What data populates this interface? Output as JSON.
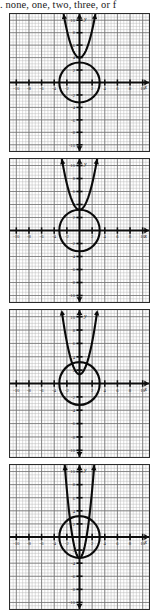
{
  "question": {
    "prefix": ".",
    "text": ". none, one, two, three, or f"
  },
  "axes": {
    "x_label": "x",
    "y_label": "y",
    "x_min": -11,
    "x_max": 11,
    "y_min": -11,
    "y_max": 11,
    "x_ticks": [
      -10,
      -8,
      -6,
      -4,
      -2,
      2,
      4,
      6,
      8,
      10
    ],
    "y_ticks": [
      -10,
      -8,
      -6,
      -4,
      -2,
      2,
      4,
      6,
      8,
      10
    ],
    "x_tick_labels": [
      "-10",
      "-8",
      "-6",
      "-4",
      "-2",
      "2",
      "4",
      "6",
      "8",
      "10"
    ],
    "y_tick_labels": [
      "-10",
      "-8",
      "-6",
      "-4",
      "-2",
      "2",
      "4",
      "6",
      "8",
      "10"
    ],
    "grid": true,
    "minor_step": 0.5,
    "major_step": 2
  },
  "colors": {
    "curve": "#0a0a0a",
    "axis": "#0d0d0d",
    "grid_minor": "#b9b9b9",
    "grid_major": "#6f6f6f",
    "panel_border": "#2b2b2b",
    "background": "#ffffff"
  },
  "chart_data": [
    {
      "type": "line",
      "id": "choice-a",
      "title": "",
      "xlabel": "x",
      "ylabel": "y",
      "xlim": [
        -11,
        11
      ],
      "ylim": [
        -11,
        11
      ],
      "grid": true,
      "intersections": 0,
      "series": [
        {
          "name": "circle",
          "kind": "circle",
          "center": [
            0,
            0
          ],
          "radius": 3.2
        },
        {
          "name": "parabola",
          "kind": "parabola",
          "vertex": [
            0,
            4.0
          ],
          "a": 1.1,
          "opens": "up"
        }
      ]
    },
    {
      "type": "line",
      "id": "choice-b",
      "title": "",
      "xlabel": "x",
      "ylabel": "y",
      "xlim": [
        -11,
        11
      ],
      "ylim": [
        -11,
        11
      ],
      "grid": true,
      "intersections": 1,
      "series": [
        {
          "name": "circle",
          "kind": "circle",
          "center": [
            0,
            0
          ],
          "radius": 3.2
        },
        {
          "name": "parabola",
          "kind": "parabola",
          "vertex": [
            0,
            3.2
          ],
          "a": 1.0,
          "opens": "up"
        }
      ]
    },
    {
      "type": "line",
      "id": "choice-c",
      "title": "",
      "xlabel": "x",
      "ylabel": "y",
      "xlim": [
        -11,
        11
      ],
      "ylim": [
        -11,
        11
      ],
      "grid": true,
      "intersections": 2,
      "series": [
        {
          "name": "circle",
          "kind": "circle",
          "center": [
            0,
            0
          ],
          "radius": 3.2
        },
        {
          "name": "parabola",
          "kind": "parabola",
          "vertex": [
            0,
            1.4
          ],
          "a": 1.2,
          "opens": "up"
        }
      ]
    },
    {
      "type": "line",
      "id": "choice-d",
      "title": "",
      "xlabel": "x",
      "ylabel": "y",
      "xlim": [
        -11,
        11
      ],
      "ylim": [
        -11,
        11
      ],
      "grid": true,
      "intersections": 4,
      "series": [
        {
          "name": "circle",
          "kind": "circle",
          "center": [
            0,
            0
          ],
          "radius": 3.2
        },
        {
          "name": "parabola",
          "kind": "parabola",
          "vertex": [
            0,
            -3.2
          ],
          "a": 2.6,
          "opens": "up"
        }
      ]
    }
  ],
  "panels": [
    {
      "id": "choice-a",
      "top": 13,
      "height": 139
    },
    {
      "id": "choice-b",
      "top": 158,
      "height": 145
    },
    {
      "id": "choice-c",
      "top": 309,
      "height": 149
    },
    {
      "id": "choice-d",
      "top": 464,
      "height": 146
    }
  ]
}
